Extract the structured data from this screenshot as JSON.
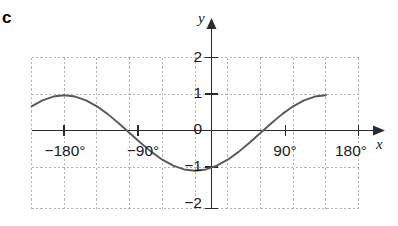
{
  "part_label": "c",
  "colors": {
    "curve": "#595959",
    "axis": "#2b2b2b",
    "grid": "#b3b3b3",
    "text": "#1a1a1a",
    "background": "#ffffff"
  },
  "axes": {
    "x_name": "x",
    "y_name": "y",
    "x_ticks": [
      "−180°",
      "−90°",
      "90°",
      "180°"
    ],
    "y_ticks": [
      "2",
      "1",
      "0",
      "−1",
      "−2"
    ]
  },
  "chart_data": {
    "type": "line",
    "title": "",
    "subtitle": "",
    "xlabel": "x",
    "ylabel": "y",
    "xlim": [
      -225,
      225
    ],
    "ylim": [
      -2,
      2
    ],
    "xticks": [
      -180,
      -90,
      90,
      180
    ],
    "xticklabels": [
      "−180°",
      "−90°",
      "90°",
      "180°"
    ],
    "yticks": [
      2,
      1,
      0,
      -1,
      -2
    ],
    "yticklabels": [
      "2",
      "1",
      "0",
      "−1",
      "−2"
    ],
    "grid": true,
    "grid_x_step": 45,
    "grid_y_step": 1,
    "legend": false,
    "annotations": [
      "c"
    ],
    "series": [
      {
        "name": "y = −cos x",
        "formula": "y = -cos(x)",
        "x": [
          -225,
          -210,
          -195,
          -180,
          -165,
          -150,
          -135,
          -120,
          -105,
          -90,
          -75,
          -60,
          -45,
          -30,
          -15,
          0,
          15,
          30,
          45,
          60,
          75,
          90,
          105,
          120,
          135,
          150,
          165,
          180
        ],
        "y": [
          0.707,
          0.866,
          0.966,
          1.0,
          0.966,
          0.866,
          0.707,
          0.5,
          0.259,
          0.0,
          -0.259,
          -0.5,
          -0.707,
          -0.866,
          -0.966,
          -1.0,
          -0.966,
          -0.866,
          -0.707,
          -0.5,
          -0.259,
          0.0,
          0.259,
          0.5,
          0.707,
          0.866,
          0.966,
          1.0
        ],
        "key_points": [
          {
            "x": -180,
            "y": 1,
            "kind": "maximum"
          },
          {
            "x": -90,
            "y": 0,
            "kind": "zero"
          },
          {
            "x": 0,
            "y": -1,
            "kind": "minimum"
          },
          {
            "x": 90,
            "y": 0,
            "kind": "zero"
          },
          {
            "x": 180,
            "y": 1,
            "kind": "maximum"
          }
        ]
      }
    ]
  },
  "tick_positions": {
    "x": [
      {
        "label": "−180°",
        "left": 38,
        "top": 143
      },
      {
        "label": "−90°",
        "left": 120,
        "top": 143
      },
      {
        "label": "90°",
        "left": 265,
        "top": 143
      },
      {
        "label": "180°",
        "left": 322,
        "top": 143
      }
    ],
    "y": [
      {
        "label": "2",
        "left": 186,
        "top": 49
      },
      {
        "label": "1",
        "left": 186,
        "top": 84
      },
      {
        "label": "0",
        "left": 186,
        "top": 121
      },
      {
        "label": "−1",
        "left": 180,
        "top": 158
      },
      {
        "label": "−2",
        "left": 180,
        "top": 195
      }
    ]
  }
}
